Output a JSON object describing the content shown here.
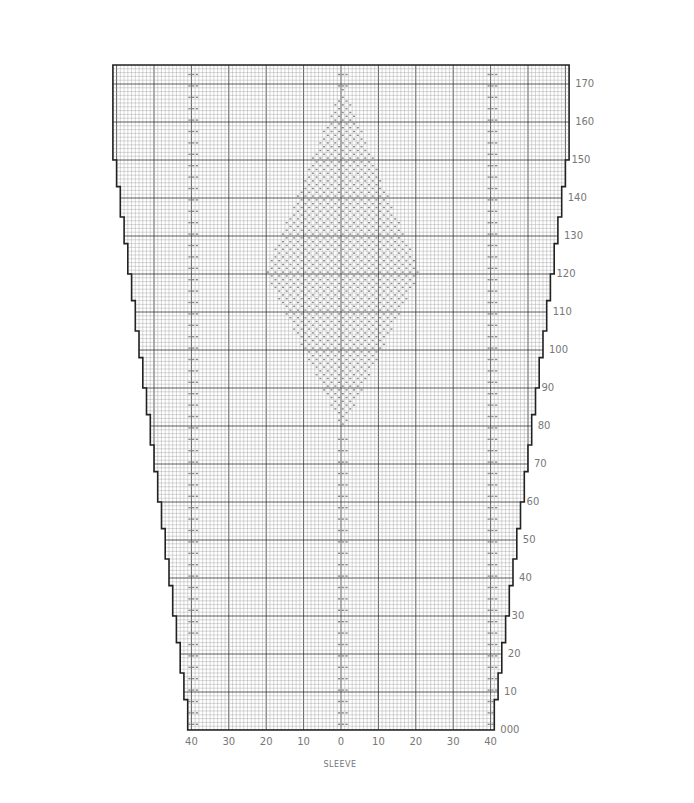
{
  "chart_data": {
    "type": "table",
    "title": "SLEEVE",
    "xlabel": "SLEEVE",
    "x_tick_labels": [
      "40",
      "30",
      "20",
      "10",
      "0",
      "10",
      "20",
      "30",
      "40"
    ],
    "y_tick_labels": [
      "000",
      "10",
      "20",
      "30",
      "40",
      "50",
      "60",
      "70",
      "80",
      "90",
      "100",
      "110",
      "120",
      "130",
      "140",
      "150",
      "160",
      "170"
    ],
    "rows": 175,
    "top_stitches_each_side": 61,
    "bottom_stitches_each_side": 41,
    "increase_shaping": "staircase increases both edges from row 0 to row 150, straight to top",
    "motif": {
      "shape": "diamond",
      "center_stitch": 0,
      "row_start": 80,
      "row_widest": 120,
      "row_end": 168,
      "half_width_stitches": 20
    },
    "vertical_markers_stitch": [
      -40,
      0,
      40
    ]
  },
  "labels": {
    "sleeve": "SLEEVE"
  }
}
